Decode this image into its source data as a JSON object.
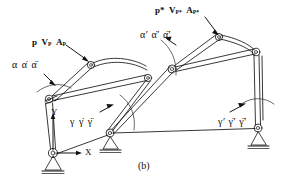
{
  "figure": {
    "caption": "(b)",
    "type": "planar-linkage-kinematic-diagram",
    "background": "#ffffff",
    "ink_color": "#111111"
  },
  "axes": {
    "y_label": "Y",
    "x_label": "X",
    "origin_note": "left ground pivot"
  },
  "labels": {
    "point_p": {
      "base": "p",
      "vel": "V",
      "vel_sub": "P",
      "acc": "A",
      "acc_sub": "P"
    },
    "point_p_star": {
      "base": "p*",
      "vel": "V",
      "vel_sub": "P*",
      "acc": "A",
      "acc_sub": "P*"
    },
    "alpha": {
      "pos": "α",
      "vel": "α̇",
      "acc": "α̈"
    },
    "alpha_prime": {
      "pos": "α′",
      "vel": "α̇′",
      "acc": "α̈′"
    },
    "gamma": {
      "pos": "γ",
      "vel": "γ̇",
      "acc": "γ̈"
    },
    "gamma_prime": {
      "pos": "γ′",
      "vel": "γ̇′",
      "acc": "γ̈′"
    }
  },
  "annotations": [
    {
      "id": "p-vp-ap",
      "text": "p V_P A_P",
      "role": "point-kinematics-left"
    },
    {
      "id": "p-star",
      "text": "p* V_P* A_P*",
      "role": "point-kinematics-right"
    },
    {
      "id": "alpha-group",
      "text": "α α̇ α̈",
      "role": "joint-angle-left"
    },
    {
      "id": "alpha-prime-group",
      "text": "α′ α̇′ α̈′",
      "role": "joint-angle-right"
    },
    {
      "id": "gamma-group",
      "text": "γ γ̇ γ̈",
      "role": "joint-angle-mid"
    },
    {
      "id": "gamma-prime-group",
      "text": "γ′ γ̇′ γ̈′",
      "role": "joint-angle-far-right"
    }
  ],
  "supports": [
    {
      "id": "ground-left",
      "x": 52,
      "y": 160
    },
    {
      "id": "ground-mid",
      "x": 110,
      "y": 140
    },
    {
      "id": "ground-right",
      "x": 258,
      "y": 135
    }
  ],
  "joints": [
    {
      "id": "joint-left-base",
      "x": 53,
      "y": 153
    },
    {
      "id": "joint-left-elbow",
      "x": 49,
      "y": 99
    },
    {
      "id": "joint-left-tip",
      "x": 91,
      "y": 65
    },
    {
      "id": "joint-mid-upper",
      "x": 148,
      "y": 78
    },
    {
      "id": "joint-mid-base",
      "x": 110,
      "y": 133
    },
    {
      "id": "joint-center",
      "x": 172,
      "y": 69
    },
    {
      "id": "joint-right-tip",
      "x": 219,
      "y": 37
    },
    {
      "id": "joint-right-upper",
      "x": 256,
      "y": 52
    },
    {
      "id": "joint-right-base",
      "x": 258,
      "y": 128
    }
  ]
}
